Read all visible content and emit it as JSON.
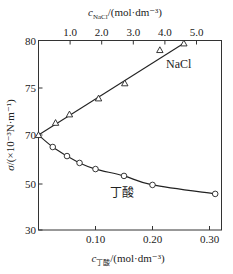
{
  "chart_data": {
    "type": "line",
    "title": "",
    "y_axis": {
      "label": "σ/(×10⁻³N·m⁻¹)",
      "ticks": [
        30,
        50,
        70,
        75,
        80
      ],
      "tick_labels": [
        "30",
        "50",
        "70",
        "75",
        "80"
      ],
      "ylim": [
        30,
        80
      ],
      "note": "broken/non-linear scale: 30–70 compressed, 70–80 expanded"
    },
    "x_axis_bottom": {
      "label_prefix": "c",
      "label_subscript": "丁酸",
      "label_unit": "/(mol·dm⁻³)",
      "ticks": [
        0.1,
        0.2,
        0.3
      ],
      "tick_labels": [
        "0.10",
        "0.20",
        "0.30"
      ],
      "xlim": [
        0,
        0.32
      ]
    },
    "x_axis_top": {
      "label_prefix": "c",
      "label_subscript": "NaCl",
      "label_unit": "/(mol·dm⁻³)",
      "ticks": [
        1.0,
        2.0,
        3.0,
        4.0,
        5.0
      ],
      "tick_labels": [
        "1.0",
        "2.0",
        "3.0",
        "4.0",
        "5.0"
      ],
      "xlim": [
        0,
        5.75
      ]
    },
    "series": [
      {
        "name": "NaCl",
        "x_axis": "top",
        "marker": "triangle",
        "x": [
          0,
          0.54,
          0.98,
          1.9,
          2.73,
          3.84,
          4.6
        ],
        "y": [
          70.0,
          71.3,
          72.2,
          73.9,
          75.5,
          79.0,
          79.7
        ]
      },
      {
        "name": "丁酸",
        "x_axis": "bottom",
        "marker": "circle",
        "x": [
          0,
          0.025,
          0.05,
          0.072,
          0.1,
          0.15,
          0.2,
          0.31
        ],
        "y": [
          70.0,
          65.1,
          61.4,
          58.6,
          56.1,
          53.3,
          49.6,
          45.7
        ]
      }
    ],
    "grid": false,
    "legend": "inline labels"
  },
  "labels": {
    "nacl": "NaCl",
    "butyric": "丁酸"
  }
}
